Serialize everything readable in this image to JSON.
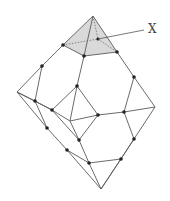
{
  "figure": {
    "label_text": "X",
    "shade_color": "#d9d9d9",
    "line_color": "#5a5a5a",
    "node_color": "#222222"
  }
}
